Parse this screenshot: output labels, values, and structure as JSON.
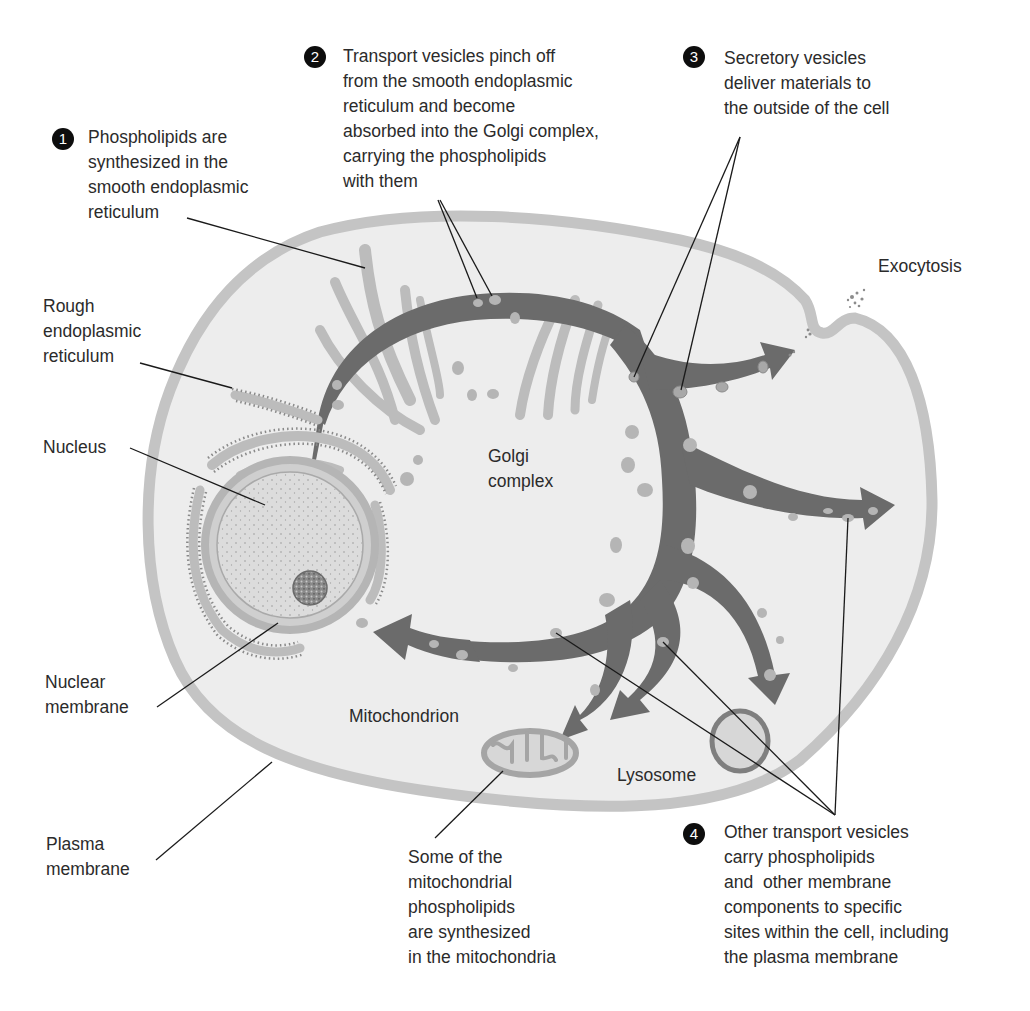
{
  "diagram": {
    "colors": {
      "background": "#ffffff",
      "cytoplasm": "#ededed",
      "plasma_membrane": "#c4c4c4",
      "pathway_arrow": "#6b6b6b",
      "vesicle": "#b5b5b5",
      "er": "#b9b9b9",
      "nucleus": "#d9d9d9",
      "label_text": "#2b2b2b",
      "step_badge": "#0d0d0d"
    },
    "steps": [
      {
        "number": "1",
        "text": "Phospholipids are\nsynthesized in the\nsmooth endoplasmic\nreticulum"
      },
      {
        "number": "2",
        "text": "Transport vesicles pinch off\nfrom the smooth endoplasmic\nreticulum and become\nabsorbed into the Golgi complex,\ncarrying the phospholipids\nwith them"
      },
      {
        "number": "3",
        "text": "Secretory vesicles\ndeliver materials to\nthe outside of the cell"
      },
      {
        "number": "4",
        "text": "Other transport vesicles\ncarry phospholipids\nand  other membrane\ncomponents to specific\nsites within the cell, including\nthe plasma membrane"
      }
    ],
    "labels": {
      "exocytosis": "Exocytosis",
      "rough_er": "Rough\nendoplasmic\nreticulum",
      "nucleus": "Nucleus",
      "golgi": "Golgi\ncomplex",
      "nuclear_membrane": "Nuclear\nmembrane",
      "mitochondrion": "Mitochondrion",
      "lysosome": "Lysosome",
      "plasma_membrane": "Plasma\nmembrane",
      "mito_note": "Some of the\nmitochondrial\nphospholipids\nare synthesized\nin the mitochondria"
    }
  }
}
